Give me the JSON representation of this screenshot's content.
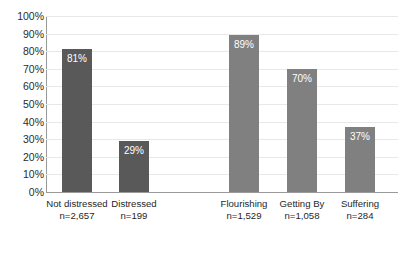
{
  "chart_data": {
    "type": "bar",
    "title": "",
    "subtitle": "",
    "xlabel": "",
    "ylabel": "",
    "ylim": [
      0,
      100
    ],
    "y_unit": "%",
    "grid": true,
    "legend": false,
    "legend_position": "none",
    "categories": [
      "Not distressed\nn=2,657",
      "Distressed\nn=199",
      "Flourishing\nn=1,529",
      "Getting By\nn=1,058",
      "Suffering\nn=284"
    ],
    "values": [
      81,
      29,
      89,
      70,
      37
    ],
    "value_labels": [
      "81%",
      "29%",
      "89%",
      "70%",
      "37%"
    ],
    "y_ticks": [
      "100%",
      "90%",
      "80%",
      "70%",
      "60%",
      "50%",
      "40%",
      "30%",
      "20%",
      "10%",
      "0%"
    ],
    "y_tick_values": [
      100,
      90,
      80,
      70,
      60,
      50,
      40,
      30,
      20,
      10,
      0
    ],
    "groups": [
      {
        "name": "distress",
        "color": "#595959",
        "categories": [
          "Not distressed\nn=2,657",
          "Distressed\nn=199"
        ],
        "values": [
          81,
          29
        ]
      },
      {
        "name": "wellbeing",
        "color": "#808080",
        "categories": [
          "Flourishing\nn=1,529",
          "Getting By\nn=1,058",
          "Suffering\nn=284"
        ],
        "values": [
          89,
          70,
          37
        ]
      }
    ],
    "bars": [
      {
        "category": "Not distressed",
        "n_label": "n=2,657",
        "value": 81,
        "value_label": "81%",
        "color": "#595959",
        "x": 62,
        "width": 30
      },
      {
        "category": "Distressed",
        "n_label": "n=199",
        "value": 29,
        "value_label": "29%",
        "color": "#595959",
        "x": 119,
        "width": 30
      },
      {
        "category": "Flourishing",
        "n_label": "n=1,529",
        "value": 89,
        "value_label": "89%",
        "color": "#808080",
        "x": 229,
        "width": 30
      },
      {
        "category": "Getting By",
        "n_label": "n=1,058",
        "value": 70,
        "value_label": "70%",
        "color": "#808080",
        "x": 287,
        "width": 30
      },
      {
        "category": "Suffering",
        "n_label": "n=284",
        "value": 37,
        "value_label": "37%",
        "color": "#808080",
        "x": 345,
        "width": 30
      }
    ],
    "colors": {
      "bar_dark": "#595959",
      "bar_light": "#808080",
      "gridline": "#e8e8e8",
      "axis": "#9a9a9a",
      "text": "#1f1f1f",
      "value_label": "#ffffff",
      "background": "#ffffff"
    }
  }
}
